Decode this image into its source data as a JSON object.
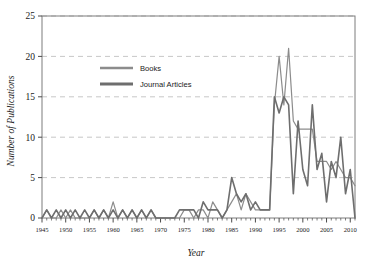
{
  "chart_data": {
    "type": "line",
    "title": "",
    "subtitle": "",
    "xlabel": "Year",
    "ylabel": "Number of Publications",
    "xlim": [
      1945,
      2011
    ],
    "ylim": [
      0,
      25
    ],
    "grid": true,
    "grid_axis": "y",
    "legend_position": "upper-left-inside",
    "y_ticks": [
      0,
      5,
      10,
      15,
      20,
      25
    ],
    "x_ticks": [
      1945,
      1950,
      1955,
      1960,
      1965,
      1970,
      1975,
      1980,
      1985,
      1990,
      1995,
      2000,
      2005,
      2010
    ],
    "x_minor_tick_step": 1,
    "x": [
      1945,
      1946,
      1947,
      1948,
      1949,
      1950,
      1951,
      1952,
      1953,
      1954,
      1955,
      1956,
      1957,
      1958,
      1959,
      1960,
      1961,
      1962,
      1963,
      1964,
      1965,
      1966,
      1967,
      1968,
      1969,
      1970,
      1971,
      1972,
      1973,
      1974,
      1975,
      1976,
      1977,
      1978,
      1979,
      1980,
      1981,
      1982,
      1983,
      1984,
      1985,
      1986,
      1987,
      1988,
      1989,
      1990,
      1991,
      1992,
      1993,
      1994,
      1995,
      1996,
      1997,
      1998,
      1999,
      2000,
      2001,
      2002,
      2003,
      2004,
      2005,
      2006,
      2007,
      2008,
      2009,
      2010,
      2011
    ],
    "series": [
      {
        "name": "Books",
        "color": "#8c8c8c",
        "width": 1.2,
        "values": [
          0,
          1,
          0,
          0,
          1,
          0,
          1,
          0,
          0,
          0,
          0,
          1,
          0,
          1,
          0,
          2,
          0,
          1,
          0,
          1,
          0,
          1,
          0,
          1,
          0,
          0,
          0,
          0,
          0,
          0,
          1,
          1,
          0,
          1,
          1,
          0,
          2,
          1,
          0,
          1,
          2,
          3,
          1,
          3,
          2,
          1,
          1,
          1,
          1,
          14,
          20,
          14,
          21,
          12,
          11,
          11,
          11,
          11,
          7,
          7,
          7,
          6,
          7,
          6,
          5,
          5,
          4
        ]
      },
      {
        "name": "Journal Articles",
        "color": "#6e6e6e",
        "width": 1.6,
        "values": [
          0,
          1,
          0,
          1,
          0,
          1,
          0,
          1,
          0,
          1,
          0,
          1,
          0,
          1,
          0,
          1,
          0,
          1,
          0,
          1,
          0,
          1,
          0,
          1,
          0,
          0,
          0,
          0,
          0,
          1,
          1,
          1,
          1,
          0,
          2,
          1,
          1,
          1,
          0,
          1,
          5,
          3,
          2,
          3,
          1,
          2,
          1,
          1,
          1,
          15,
          13,
          15,
          14,
          3,
          12,
          6,
          4,
          14,
          6,
          8,
          2,
          7,
          5,
          10,
          3,
          6,
          0
        ]
      }
    ],
    "legend": [
      {
        "label": "Books"
      },
      {
        "label": "Journal Articles"
      }
    ]
  },
  "style": {
    "frame_color": "#7d7d7d",
    "grid_color": "#b9b9b9",
    "tick_color": "#4a4a4a",
    "text_color": "#1a1a1a",
    "background": "#ffffff"
  }
}
